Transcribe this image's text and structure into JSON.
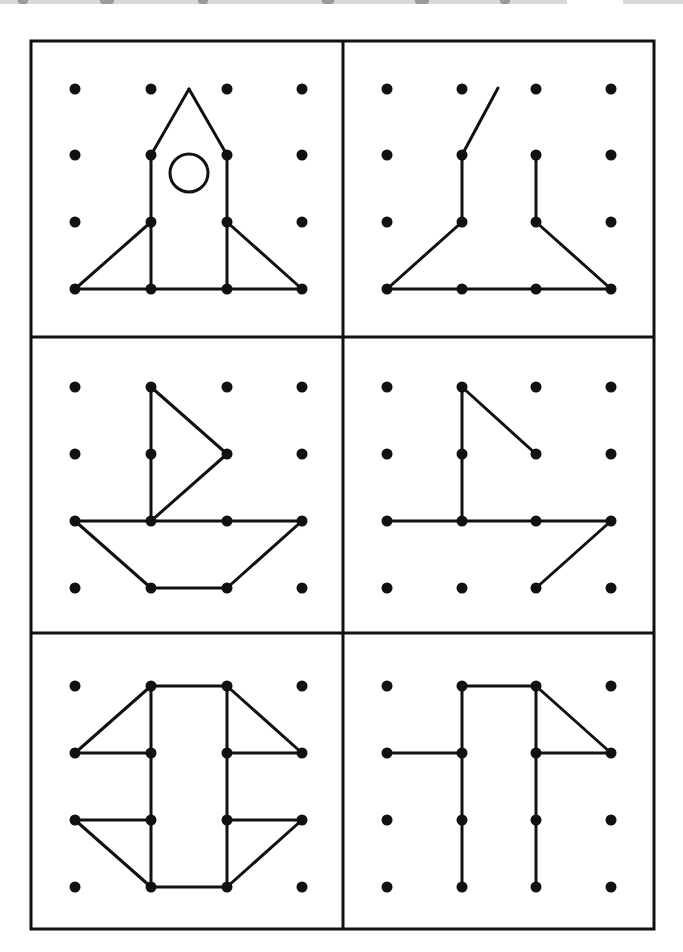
{
  "page": {
    "background": "#ffffff",
    "ink": "#111111",
    "top_bleed_label": "nr. 2"
  },
  "frame": {
    "x": 31,
    "y": 41,
    "width": 623,
    "height": 888,
    "stroke_width": 3
  },
  "dividers": {
    "vertical_x": 343,
    "horizontal_y": [
      337,
      633
    ]
  },
  "panels": [
    {
      "id": "rocket-model",
      "role": "model",
      "dots_x": [
        75,
        151,
        227,
        302
      ],
      "dots_y": [
        89,
        155,
        222,
        289
      ],
      "segments": [
        [
          [
            75,
            289
          ],
          [
            302,
            289
          ]
        ],
        [
          [
            151,
            155
          ],
          [
            151,
            289
          ]
        ],
        [
          [
            227,
            155
          ],
          [
            227,
            289
          ]
        ],
        [
          [
            151,
            155
          ],
          [
            189,
            89
          ]
        ],
        [
          [
            189,
            89
          ],
          [
            227,
            155
          ]
        ],
        [
          [
            75,
            289
          ],
          [
            151,
            222
          ]
        ],
        [
          [
            227,
            222
          ],
          [
            302,
            289
          ]
        ]
      ],
      "circles": [
        {
          "cx": 189,
          "cy": 173,
          "r": 19
        }
      ]
    },
    {
      "id": "rocket-copy",
      "role": "copy",
      "dots_x": [
        387,
        462,
        536,
        611
      ],
      "dots_y": [
        89,
        155,
        222,
        289
      ],
      "segments": [
        [
          [
            387,
            289
          ],
          [
            611,
            289
          ]
        ],
        [
          [
            462,
            155
          ],
          [
            462,
            222
          ]
        ],
        [
          [
            536,
            155
          ],
          [
            536,
            222
          ]
        ],
        [
          [
            462,
            155
          ],
          [
            498,
            88
          ]
        ],
        [
          [
            387,
            289
          ],
          [
            462,
            222
          ]
        ],
        [
          [
            536,
            222
          ],
          [
            611,
            289
          ]
        ]
      ],
      "circles": []
    },
    {
      "id": "boat-model",
      "role": "model",
      "dots_x": [
        75,
        151,
        227,
        302
      ],
      "dots_y": [
        387,
        454,
        521,
        588
      ],
      "segments": [
        [
          [
            151,
            387
          ],
          [
            151,
            521
          ]
        ],
        [
          [
            151,
            387
          ],
          [
            227,
            454
          ]
        ],
        [
          [
            227,
            454
          ],
          [
            151,
            521
          ]
        ],
        [
          [
            75,
            521
          ],
          [
            302,
            521
          ]
        ],
        [
          [
            75,
            521
          ],
          [
            151,
            588
          ]
        ],
        [
          [
            151,
            588
          ],
          [
            227,
            588
          ]
        ],
        [
          [
            227,
            588
          ],
          [
            302,
            521
          ]
        ]
      ],
      "circles": []
    },
    {
      "id": "boat-copy",
      "role": "copy",
      "dots_x": [
        387,
        462,
        536,
        611
      ],
      "dots_y": [
        387,
        454,
        521,
        588
      ],
      "segments": [
        [
          [
            462,
            387
          ],
          [
            462,
            521
          ]
        ],
        [
          [
            462,
            387
          ],
          [
            536,
            454
          ]
        ],
        [
          [
            387,
            521
          ],
          [
            611,
            521
          ]
        ],
        [
          [
            611,
            521
          ],
          [
            536,
            588
          ]
        ]
      ],
      "circles": []
    },
    {
      "id": "robot-model",
      "role": "model",
      "dots_x": [
        75,
        151,
        227,
        302
      ],
      "dots_y": [
        686,
        753,
        820,
        887
      ],
      "segments": [
        [
          [
            151,
            686
          ],
          [
            227,
            686
          ]
        ],
        [
          [
            151,
            686
          ],
          [
            151,
            887
          ]
        ],
        [
          [
            227,
            686
          ],
          [
            227,
            887
          ]
        ],
        [
          [
            151,
            887
          ],
          [
            227,
            887
          ]
        ],
        [
          [
            151,
            686
          ],
          [
            75,
            753
          ]
        ],
        [
          [
            75,
            753
          ],
          [
            151,
            753
          ]
        ],
        [
          [
            227,
            686
          ],
          [
            302,
            753
          ]
        ],
        [
          [
            227,
            753
          ],
          [
            302,
            753
          ]
        ],
        [
          [
            75,
            820
          ],
          [
            151,
            820
          ]
        ],
        [
          [
            75,
            820
          ],
          [
            151,
            887
          ]
        ],
        [
          [
            227,
            820
          ],
          [
            302,
            820
          ]
        ],
        [
          [
            302,
            820
          ],
          [
            227,
            887
          ]
        ]
      ],
      "circles": []
    },
    {
      "id": "robot-copy",
      "role": "copy",
      "dots_x": [
        387,
        462,
        536,
        611
      ],
      "dots_y": [
        686,
        753,
        820,
        887
      ],
      "segments": [
        [
          [
            462,
            686
          ],
          [
            536,
            686
          ]
        ],
        [
          [
            462,
            686
          ],
          [
            462,
            887
          ]
        ],
        [
          [
            536,
            686
          ],
          [
            536,
            887
          ]
        ],
        [
          [
            387,
            753
          ],
          [
            462,
            753
          ]
        ],
        [
          [
            536,
            686
          ],
          [
            611,
            753
          ]
        ],
        [
          [
            536,
            753
          ],
          [
            611,
            753
          ]
        ]
      ],
      "circles": []
    }
  ],
  "style": {
    "dot_radius": 5.5,
    "line_width": 3
  }
}
